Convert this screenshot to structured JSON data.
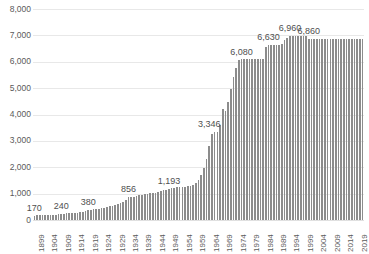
{
  "chart_data": {
    "type": "bar",
    "title": "",
    "subtitle": "",
    "xlabel": "",
    "ylabel": "",
    "xlim": [
      1899,
      2021
    ],
    "ylim": [
      0,
      8000
    ],
    "y_ticks": [
      0,
      1000,
      2000,
      3000,
      4000,
      5000,
      6000,
      7000,
      8000
    ],
    "y_tick_labels": [
      "0",
      "1,000",
      "2,000",
      "3,000",
      "4,000",
      "5,000",
      "6,000",
      "7,000",
      "8,000"
    ],
    "x_tick_labels": [
      "1899",
      "1904",
      "1909",
      "1914",
      "1919",
      "1924",
      "1929",
      "1934",
      "1939",
      "1944",
      "1949",
      "1954",
      "1959",
      "1964",
      "1969",
      "1974",
      "1979",
      "1984",
      "1989",
      "1994",
      "1999",
      "2004",
      "2009",
      "2014",
      "2019"
    ],
    "x_tick_step": 5,
    "grid": true,
    "legend": false,
    "legend_position": "none",
    "bar_color": "#8c8c8c",
    "gridline_color": "#e8e8e8",
    "annotations": [
      {
        "label": "170",
        "year": 1899,
        "value": 170
      },
      {
        "label": "240",
        "year": 1909,
        "value": 240
      },
      {
        "label": "380",
        "year": 1919,
        "value": 380
      },
      {
        "label": "856",
        "year": 1934,
        "value": 856
      },
      {
        "label": "1,193",
        "year": 1949,
        "value": 1193
      },
      {
        "label": "3,346",
        "year": 1964,
        "value": 3346
      },
      {
        "label": "6,080",
        "year": 1976,
        "value": 6080
      },
      {
        "label": "6,630",
        "year": 1986,
        "value": 6630
      },
      {
        "label": "6,960",
        "year": 1994,
        "value": 6960
      },
      {
        "label": "6,860",
        "year": 2001,
        "value": 6860
      }
    ],
    "x": [
      1899,
      1900,
      1901,
      1902,
      1903,
      1904,
      1905,
      1906,
      1907,
      1908,
      1909,
      1910,
      1911,
      1912,
      1913,
      1914,
      1915,
      1916,
      1917,
      1918,
      1919,
      1920,
      1921,
      1922,
      1923,
      1924,
      1925,
      1926,
      1927,
      1928,
      1929,
      1930,
      1931,
      1932,
      1933,
      1934,
      1935,
      1936,
      1937,
      1938,
      1939,
      1940,
      1941,
      1942,
      1943,
      1944,
      1945,
      1946,
      1947,
      1948,
      1949,
      1950,
      1951,
      1952,
      1953,
      1954,
      1955,
      1956,
      1957,
      1958,
      1959,
      1960,
      1961,
      1962,
      1963,
      1964,
      1965,
      1966,
      1967,
      1968,
      1969,
      1970,
      1971,
      1972,
      1973,
      1974,
      1975,
      1976,
      1977,
      1978,
      1979,
      1980,
      1981,
      1982,
      1983,
      1984,
      1985,
      1986,
      1987,
      1988,
      1989,
      1990,
      1991,
      1992,
      1993,
      1994,
      1995,
      1996,
      1997,
      1998,
      1999,
      2000,
      2001,
      2002,
      2003,
      2004,
      2005,
      2006,
      2007,
      2008,
      2009,
      2010,
      2011,
      2012,
      2013,
      2014,
      2015,
      2016,
      2017,
      2018,
      2019,
      2020,
      2021
    ],
    "values": [
      170,
      172,
      175,
      178,
      182,
      186,
      190,
      196,
      202,
      210,
      240,
      246,
      252,
      258,
      264,
      272,
      280,
      292,
      305,
      330,
      380,
      392,
      404,
      416,
      430,
      452,
      470,
      492,
      515,
      540,
      566,
      600,
      650,
      700,
      770,
      856,
      862,
      880,
      905,
      930,
      960,
      985,
      1000,
      1010,
      1020,
      1035,
      1060,
      1090,
      1120,
      1155,
      1193,
      1210,
      1230,
      1245,
      1255,
      1262,
      1268,
      1275,
      1290,
      1330,
      1400,
      1520,
      1700,
      1960,
      2300,
      2820,
      3280,
      3340,
      3350,
      3600,
      4220,
      4150,
      4480,
      4960,
      5420,
      5760,
      6080,
      6090,
      6095,
      6100,
      6100,
      6100,
      6100,
      6100,
      6105,
      6110,
      6550,
      6630,
      6635,
      6640,
      6645,
      6650,
      6660,
      6820,
      6900,
      6960,
      6960,
      6960,
      6960,
      6960,
      6960,
      6960,
      6860,
      6860,
      6860,
      6860,
      6860,
      6860,
      6860,
      6860,
      6860,
      6860,
      6860,
      6860,
      6860,
      6860,
      6860,
      6860,
      6860,
      6860,
      6860,
      6860,
      6860
    ]
  }
}
